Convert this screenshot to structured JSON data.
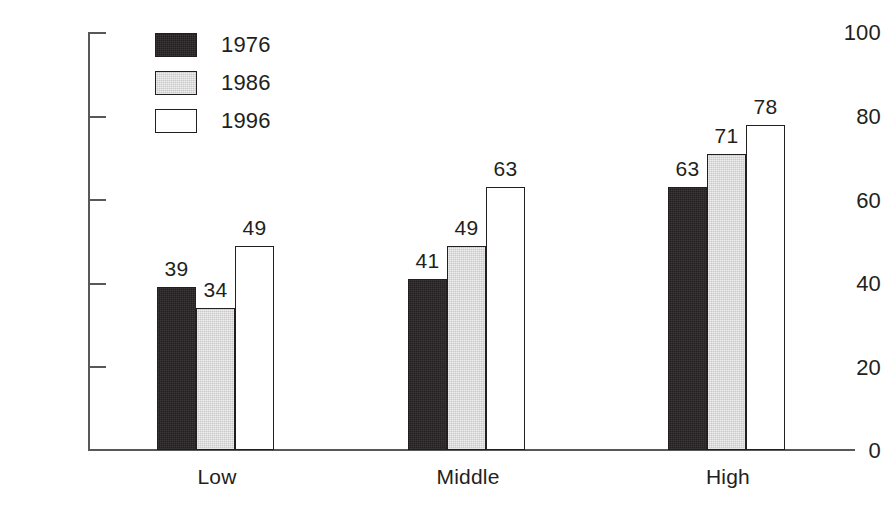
{
  "chart_data": {
    "type": "bar",
    "title": "",
    "xlabel": "",
    "ylabel": "Percent",
    "ylim": [
      0,
      100
    ],
    "yticks": [
      0,
      20,
      40,
      60,
      80,
      100
    ],
    "grid": false,
    "legend_position": "top-left",
    "categories": [
      "Low",
      "Middle",
      "High"
    ],
    "series": [
      {
        "name": "1976",
        "color": "#231f20",
        "fill": "dark",
        "values": [
          39,
          41,
          63
        ]
      },
      {
        "name": "1986",
        "color": "#c9c9c9",
        "fill": "gray",
        "values": [
          34,
          49,
          71
        ]
      },
      {
        "name": "1996",
        "color": "#ffffff",
        "fill": "white",
        "values": [
          49,
          63,
          78
        ]
      }
    ],
    "data_labels": [
      "39",
      "34",
      "49",
      "41",
      "49",
      "63",
      "63",
      "71",
      "78"
    ]
  },
  "axis": {
    "y_title": "Percent",
    "y_tick_labels": [
      "100",
      "80",
      "60",
      "40",
      "20",
      "0"
    ],
    "x_tick_labels": [
      "Low",
      "Middle",
      "High"
    ]
  },
  "legend": {
    "items": [
      {
        "label": "1976"
      },
      {
        "label": "1986"
      },
      {
        "label": "1996"
      }
    ]
  },
  "bars": [
    {
      "group": "Low",
      "series": "1976",
      "value": 39,
      "label": "39"
    },
    {
      "group": "Low",
      "series": "1986",
      "value": 34,
      "label": "34"
    },
    {
      "group": "Low",
      "series": "1996",
      "value": 49,
      "label": "49"
    },
    {
      "group": "Middle",
      "series": "1976",
      "value": 41,
      "label": "41"
    },
    {
      "group": "Middle",
      "series": "1986",
      "value": 49,
      "label": "49"
    },
    {
      "group": "Middle",
      "series": "1996",
      "value": 63,
      "label": "63"
    },
    {
      "group": "High",
      "series": "1976",
      "value": 63,
      "label": "63"
    },
    {
      "group": "High",
      "series": "1986",
      "value": 71,
      "label": "71"
    },
    {
      "group": "High",
      "series": "1996",
      "value": 78,
      "label": "78"
    }
  ],
  "colors": {
    "axis": "#58585a",
    "text": "#231f20",
    "series_1976": "#231f20",
    "series_1986": "#c9c9c9",
    "series_1996": "#ffffff",
    "background": "#ffffff"
  }
}
